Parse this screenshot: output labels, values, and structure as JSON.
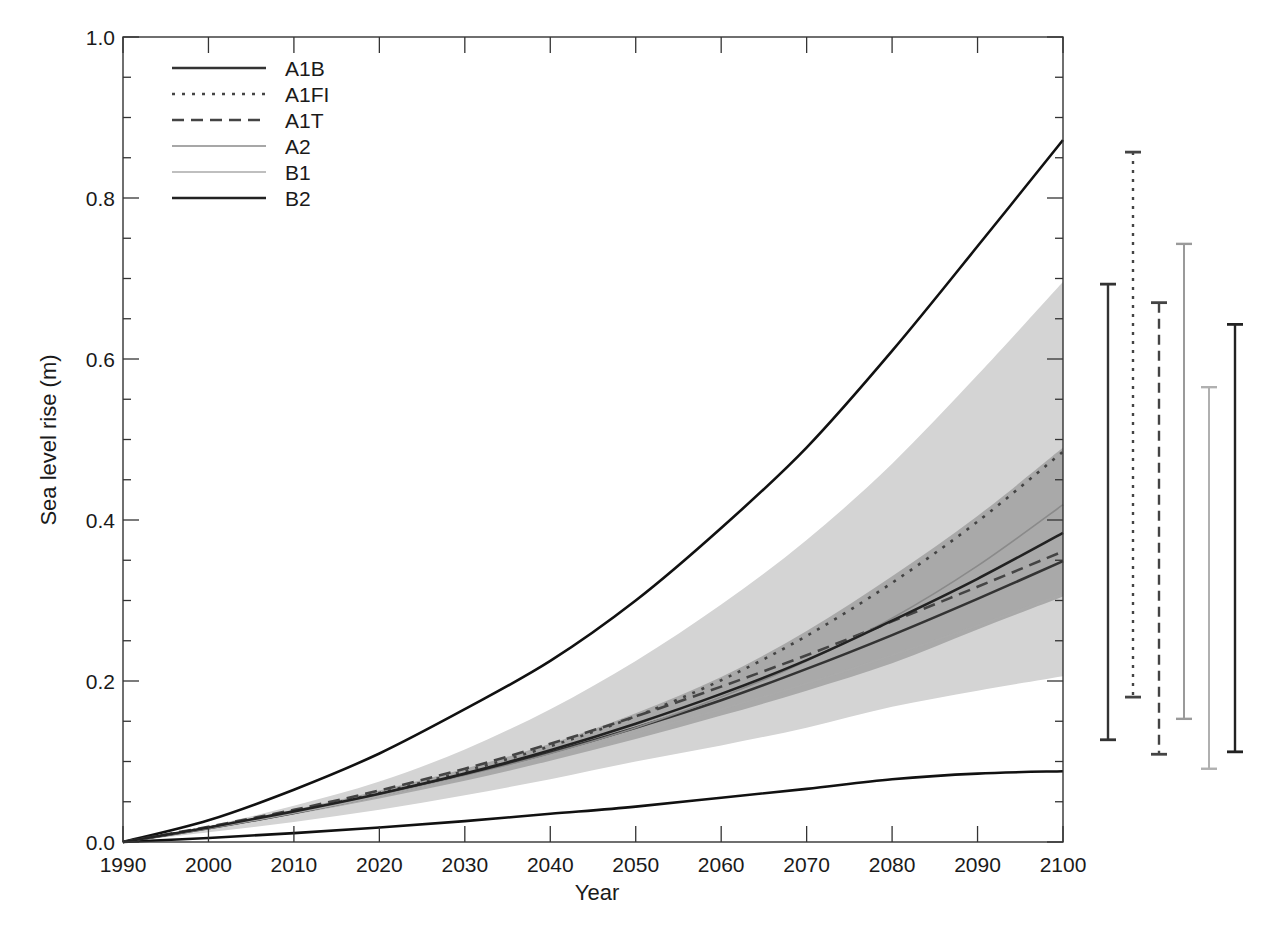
{
  "chart_data": {
    "type": "line",
    "title": "",
    "xlabel": "Year",
    "ylabel": "Sea level rise (m)",
    "xlim": [
      1990,
      2100
    ],
    "ylim": [
      0.0,
      1.0
    ],
    "grid": false,
    "legend_position": "upper-left",
    "x_ticks": [
      "1990",
      "2000",
      "2010",
      "2020",
      "2030",
      "2040",
      "2050",
      "2060",
      "2070",
      "2080",
      "2090",
      "2100"
    ],
    "y_ticks": [
      "0.0",
      "0.2",
      "0.4",
      "0.6",
      "0.8",
      "1.0"
    ],
    "x": [
      1990,
      2000,
      2010,
      2020,
      2030,
      2040,
      2050,
      2060,
      2070,
      2080,
      2090,
      2100
    ],
    "series": [
      {
        "name": "A1B",
        "style": "solid",
        "color": "#333333",
        "values": [
          0.0,
          0.017,
          0.036,
          0.058,
          0.083,
          0.111,
          0.142,
          0.176,
          0.215,
          0.257,
          0.302,
          0.349
        ]
      },
      {
        "name": "A1FI",
        "style": "dotted",
        "color": "#444444",
        "values": [
          0.0,
          0.018,
          0.038,
          0.061,
          0.088,
          0.119,
          0.156,
          0.201,
          0.256,
          0.322,
          0.398,
          0.485
        ]
      },
      {
        "name": "A1T",
        "style": "dashed",
        "color": "#444444",
        "values": [
          0.0,
          0.019,
          0.04,
          0.064,
          0.091,
          0.122,
          0.156,
          0.193,
          0.232,
          0.274,
          0.317,
          0.361
        ]
      },
      {
        "name": "A2",
        "style": "solid",
        "color": "#8a8a8a",
        "values": [
          0.0,
          0.017,
          0.036,
          0.058,
          0.082,
          0.11,
          0.142,
          0.18,
          0.225,
          0.278,
          0.343,
          0.419
        ]
      },
      {
        "name": "B1",
        "style": "solid",
        "color": "#aaaaaa",
        "values": [
          0.0,
          0.017,
          0.036,
          0.057,
          0.081,
          0.107,
          0.135,
          0.165,
          0.197,
          0.232,
          0.269,
          0.308
        ]
      },
      {
        "name": "B2",
        "style": "solid",
        "color": "#222222",
        "values": [
          0.0,
          0.018,
          0.038,
          0.06,
          0.085,
          0.114,
          0.147,
          0.184,
          0.226,
          0.275,
          0.327,
          0.384
        ]
      }
    ],
    "envelopes": {
      "outer_upper": [
        0.0,
        0.027,
        0.065,
        0.11,
        0.165,
        0.225,
        0.3,
        0.39,
        0.49,
        0.61,
        0.74,
        0.872
      ],
      "outer_lower": [
        0.0,
        0.005,
        0.011,
        0.018,
        0.026,
        0.035,
        0.044,
        0.055,
        0.066,
        0.078,
        0.085,
        0.088
      ],
      "light_band_upper": [
        0.0,
        0.02,
        0.045,
        0.075,
        0.115,
        0.165,
        0.225,
        0.295,
        0.375,
        0.47,
        0.58,
        0.696
      ],
      "light_band_lower": [
        0.0,
        0.012,
        0.025,
        0.04,
        0.058,
        0.078,
        0.1,
        0.12,
        0.142,
        0.168,
        0.188,
        0.206
      ],
      "dark_band_upper": [
        0.0,
        0.019,
        0.04,
        0.064,
        0.091,
        0.122,
        0.16,
        0.205,
        0.262,
        0.33,
        0.405,
        0.49
      ],
      "dark_band_lower": [
        0.0,
        0.016,
        0.034,
        0.054,
        0.076,
        0.101,
        0.128,
        0.157,
        0.188,
        0.222,
        0.264,
        0.305
      ]
    },
    "range_bars_2100": [
      {
        "name": "A1B",
        "style": "solid",
        "color": "#333333",
        "low": 0.127,
        "high": 0.693
      },
      {
        "name": "A1FI",
        "style": "dotted",
        "color": "#444444",
        "low": 0.18,
        "high": 0.857
      },
      {
        "name": "A1T",
        "style": "dashed",
        "color": "#444444",
        "low": 0.109,
        "high": 0.67
      },
      {
        "name": "A2",
        "style": "solid",
        "color": "#9a9a9a",
        "low": 0.153,
        "high": 0.743
      },
      {
        "name": "B1",
        "style": "solid",
        "color": "#b0b0b0",
        "low": 0.091,
        "high": 0.565
      },
      {
        "name": "B2",
        "style": "solid",
        "color": "#222222",
        "low": 0.112,
        "high": 0.643
      }
    ]
  },
  "legend": {
    "items": [
      {
        "label": "A1B"
      },
      {
        "label": "A1FI"
      },
      {
        "label": "A1T"
      },
      {
        "label": "A2"
      },
      {
        "label": "B1"
      },
      {
        "label": "B2"
      }
    ]
  },
  "axes": {
    "xlabel": "Year",
    "ylabel": "Sea level rise (m)",
    "x_ticks": [
      "1990",
      "2000",
      "2010",
      "2020",
      "2030",
      "2040",
      "2050",
      "2060",
      "2070",
      "2080",
      "2090",
      "2100"
    ],
    "y_ticks": [
      "0.0",
      "0.2",
      "0.4",
      "0.6",
      "0.8",
      "1.0"
    ]
  },
  "colors": {
    "light_band": "#d4d4d4",
    "dark_band": "#a9a9a9",
    "envelope_line": "#111111",
    "axis": "#333333"
  }
}
